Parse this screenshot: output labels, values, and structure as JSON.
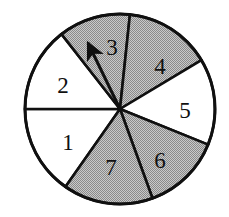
{
  "figure": {
    "name": "spinner-wheel",
    "width": 229,
    "height": 217,
    "background_color": "#ffffff",
    "outline_color": "#101010",
    "shaded_fill": "#a8a8a8",
    "unshaded_fill": "#ffffff",
    "pointer_color": "#101010"
  },
  "circle": {
    "center_x": 120,
    "center_y": 109,
    "radius": 95,
    "stroke_width": 3
  },
  "chart_data": {
    "type": "pie",
    "xlabel": "",
    "ylabel": "",
    "categories": [
      "1",
      "2",
      "3",
      "4",
      "5",
      "6",
      "7"
    ],
    "values": [
      55,
      52,
      44,
      53,
      53,
      48,
      55
    ],
    "units": "degrees",
    "legend": "none",
    "grid": false,
    "annotations": [
      "pointer arrow from center into sector 3"
    ]
  },
  "sectors": [
    {
      "id": "sector-1",
      "label": "1",
      "shaded": false,
      "fill": "#ffffff",
      "start_angle": 180,
      "end_angle": 235,
      "label_x": 68,
      "label_y": 145
    },
    {
      "id": "sector-2",
      "label": "2",
      "shaded": false,
      "fill": "#ffffff",
      "start_angle": 128,
      "end_angle": 180,
      "label_x": 63,
      "label_y": 88
    },
    {
      "id": "sector-3",
      "label": "3",
      "shaded": true,
      "fill": "#a8a8a8",
      "start_angle": 84,
      "end_angle": 128,
      "label_x": 112,
      "label_y": 50
    },
    {
      "id": "sector-4",
      "label": "4",
      "shaded": true,
      "fill": "#a8a8a8",
      "start_angle": 31,
      "end_angle": 84,
      "label_x": 160,
      "label_y": 69
    },
    {
      "id": "sector-5",
      "label": "5",
      "shaded": false,
      "fill": "#ffffff",
      "start_angle": -22,
      "end_angle": 31,
      "label_x": 185,
      "label_y": 113
    },
    {
      "id": "sector-6",
      "label": "6",
      "shaded": true,
      "fill": "#a8a8a8",
      "start_angle": -70,
      "end_angle": -22,
      "label_x": 160,
      "label_y": 163
    },
    {
      "id": "sector-7",
      "label": "7",
      "shaded": true,
      "fill": "#a8a8a8",
      "start_angle": -125,
      "end_angle": -70,
      "label_x": 111,
      "label_y": 170
    }
  ],
  "pointer": {
    "name": "pointer-arrow",
    "from_x": 120,
    "from_y": 109,
    "to_x": 88,
    "to_y": 43,
    "points_at_sector": "3",
    "head_length": 22,
    "head_width": 15
  }
}
